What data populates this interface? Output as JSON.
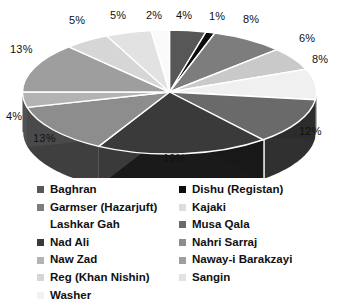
{
  "chart_data": {
    "type": "pie",
    "title": "",
    "subtitle": "",
    "xlabel": "",
    "ylabel": "",
    "grid": false,
    "legend_position": "bottom",
    "three_d": true,
    "value_suffix": "%",
    "start_angle_deg": 0,
    "direction": "clockwise",
    "categories": [
      "Baghran",
      "Dishu (Registan)",
      "Garmser (Hazarjuft)",
      "Kajaki",
      "Lashkar Gah",
      "Musa Qala",
      "Nad Ali",
      "Nahri Sarraj",
      "Naw Zad",
      "Naway-i Barakzayi",
      "Reg (Khan Nishin)",
      "Sangin",
      "Washer"
    ],
    "values": [
      4,
      1,
      8,
      6,
      8,
      12,
      19,
      13,
      4,
      13,
      5,
      5,
      2
    ],
    "labels": [
      "4%",
      "1%",
      "8%",
      "6%",
      "8%",
      "12%",
      "19%",
      "13%",
      "4%",
      "13%",
      "5%",
      "5%",
      "2%"
    ],
    "colors": [
      "#575757",
      "#0d0d0d",
      "#7d7d7d",
      "#c9c9c9",
      "#f0f0f0",
      "#6a6a6a",
      "#3a3a3a",
      "#8d8d8d",
      "#b3b3b3",
      "#9e9e9e",
      "#d6d6d6",
      "#e2e2e2",
      "#fafafa"
    ],
    "slice_label_positions": [
      {
        "label": "4%",
        "x": 176,
        "y": 9
      },
      {
        "label": "1%",
        "x": 209,
        "y": 10
      },
      {
        "label": "8%",
        "x": 243,
        "y": 13
      },
      {
        "label": "6%",
        "x": 299,
        "y": 32
      },
      {
        "label": "8%",
        "x": 312,
        "y": 53
      },
      {
        "label": "12%",
        "x": 299,
        "y": 125
      },
      {
        "label": "19%",
        "x": 163,
        "y": 152
      },
      {
        "label": "13%",
        "x": 33,
        "y": 132
      },
      {
        "label": "4%",
        "x": 6,
        "y": 110
      },
      {
        "label": "13%",
        "x": 10,
        "y": 43
      },
      {
        "label": "5%",
        "x": 69,
        "y": 14
      },
      {
        "label": "5%",
        "x": 110,
        "y": 9
      },
      {
        "label": "2%",
        "x": 146,
        "y": 9
      }
    ]
  },
  "legend": {
    "columns": [
      {
        "name": "legend-column-left",
        "items": [
          {
            "label": "Baghran",
            "color": "#575757",
            "swatch_visible": true
          },
          {
            "label": "Garmser (Hazarjuft)",
            "color": "#7d7d7d",
            "swatch_visible": true
          },
          {
            "label": "Lashkar Gah",
            "color": "#ffffff",
            "swatch_visible": false
          },
          {
            "label": "Nad Ali",
            "color": "#3a3a3a",
            "swatch_visible": true
          },
          {
            "label": "Naw Zad",
            "color": "#b3b3b3",
            "swatch_visible": true
          },
          {
            "label": "Reg (Khan Nishin)",
            "color": "#d6d6d6",
            "swatch_visible": true
          },
          {
            "label": "Washer",
            "color": "#f2f2f2",
            "swatch_visible": true
          }
        ]
      },
      {
        "name": "legend-column-right",
        "items": [
          {
            "label": "Dishu (Registan)",
            "color": "#0d0d0d",
            "swatch_visible": true
          },
          {
            "label": "Kajaki",
            "color": "#dddddd",
            "swatch_visible": true
          },
          {
            "label": "Musa Qala",
            "color": "#6a6a6a",
            "swatch_visible": true
          },
          {
            "label": "Nahri Sarraj",
            "color": "#8d8d8d",
            "swatch_visible": true
          },
          {
            "label": "Naway-i Barakzayi",
            "color": "#9e9e9e",
            "swatch_visible": true
          },
          {
            "label": "Sangin",
            "color": "#e2e2e2",
            "swatch_visible": true
          }
        ]
      }
    ]
  },
  "style": {
    "background": "#ffffff",
    "label_color": "#111111",
    "slice_border": "#ffffff",
    "depth_shade_factor": 0.45
  }
}
